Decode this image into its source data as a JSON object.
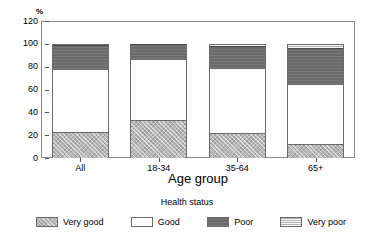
{
  "chart_data": {
    "type": "bar",
    "subtype": "stacked-percentage",
    "title": "",
    "xlabel": "Age group",
    "ylabel": "",
    "unit_label": "%",
    "categories": [
      "All",
      "18-34",
      "35-64",
      "65+"
    ],
    "ylim": [
      0,
      120
    ],
    "yticks": [
      0,
      20,
      40,
      60,
      80,
      100,
      120
    ],
    "ytick_labels": [
      "0",
      "20",
      "40",
      "60",
      "80",
      "100",
      "120"
    ],
    "grid": false,
    "legend_title": "Health status",
    "legend_position": "bottom",
    "series": [
      {
        "name": "Very good",
        "values": [
          23,
          33,
          22,
          12
        ],
        "color": "#b6b6b6",
        "pattern": "cross-hatch"
      },
      {
        "name": "Good",
        "values": [
          55,
          54,
          57,
          53
        ],
        "color": "#ffffff",
        "pattern": "solid"
      },
      {
        "name": "Poor",
        "values": [
          21,
          13,
          19,
          31
        ],
        "color": "#6a6a6a",
        "pattern": "dark-solid"
      },
      {
        "name": "Very poor",
        "values": [
          1,
          0,
          2,
          4
        ],
        "color": "#cfcfcf",
        "pattern": "horizontal-lines"
      }
    ],
    "cumulative_tops": {
      "All": [
        23,
        78,
        99,
        100
      ],
      "18-34": [
        33,
        87,
        100,
        100
      ],
      "35-64": [
        22,
        79,
        98,
        100
      ],
      "65+": [
        12,
        65,
        96,
        100
      ]
    }
  },
  "axes": {
    "y": {
      "ticks": [
        {
          "label": "120",
          "value": 120
        },
        {
          "label": "100",
          "value": 100
        },
        {
          "label": "80",
          "value": 80
        },
        {
          "label": "60",
          "value": 60
        },
        {
          "label": "40",
          "value": 40
        },
        {
          "label": "20",
          "value": 20
        },
        {
          "label": "0",
          "value": 0
        }
      ],
      "unit": "%"
    },
    "x": {
      "title": "Age group",
      "ticks": [
        {
          "label": "All"
        },
        {
          "label": "18-34"
        },
        {
          "label": "35-64"
        },
        {
          "label": "65+"
        }
      ]
    }
  },
  "legend": {
    "title": "Health status",
    "items": [
      {
        "label": "Very good"
      },
      {
        "label": "Good"
      },
      {
        "label": "Poor"
      },
      {
        "label": "Very poor"
      }
    ]
  }
}
